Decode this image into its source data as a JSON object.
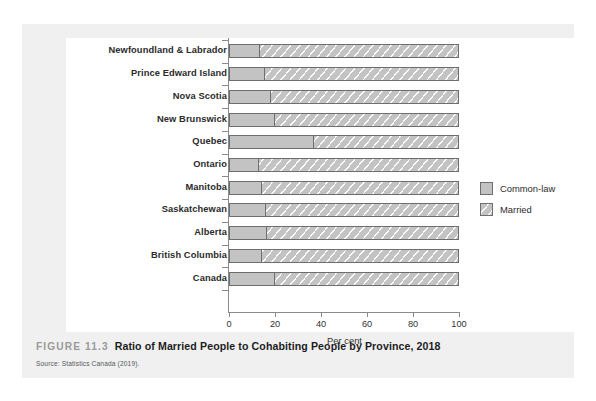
{
  "figure": {
    "number_label": "FIGURE 11.3",
    "title": "Ratio of Married People to Cohabiting People by Province, 2018",
    "source": "Source: Statistics Canada (2019)."
  },
  "legend": {
    "position": "right",
    "items": [
      {
        "label": "Common-law",
        "swatch": "solid-gray-swatch",
        "color": "#c3c3c3"
      },
      {
        "label": "Married",
        "swatch": "hatched-gray-swatch",
        "color": "#c3c3c3"
      }
    ]
  },
  "chart_data": {
    "type": "bar",
    "orientation": "horizontal",
    "stacked": true,
    "stacked_mode": "percent",
    "title": "Ratio of Married People to Cohabiting People by Province, 2018",
    "xlabel": "Per cent",
    "ylabel": "",
    "xlim": [
      0,
      100
    ],
    "xticks": [
      0,
      20,
      40,
      60,
      80,
      100
    ],
    "xtick_labels": [
      "0",
      "20",
      "40",
      "60",
      "80",
      "100"
    ],
    "grid": false,
    "legend_position": "right",
    "categories": [
      "Newfoundland & Labrador",
      "Prince Edward Island",
      "Nova Scotia",
      "New Brunswick",
      "Quebec",
      "Ontario",
      "Manitoba",
      "Saskatchewan",
      "Alberta",
      "British Columbia",
      "Canada"
    ],
    "series": [
      {
        "name": "Common-law",
        "values": [
          13,
          15,
          18,
          19.5,
          36.5,
          12.5,
          14,
          15.5,
          16,
          14,
          19.5
        ]
      },
      {
        "name": "Married",
        "values": [
          87,
          85,
          82,
          80.5,
          63.5,
          87.5,
          86,
          84.5,
          84,
          86,
          80.5
        ]
      }
    ]
  },
  "colors": {
    "bar_fill": "#c3c3c3",
    "bar_stroke": "#6e6e6e",
    "axis": "#8a8a8a",
    "card_background": "#f0f0f0",
    "panel_background": "#ffffff",
    "figure_number": "#9a9a9a"
  }
}
